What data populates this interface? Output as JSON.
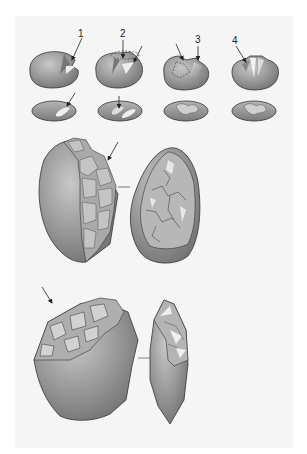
{
  "figure": {
    "type": "illustration",
    "background_color": "#ffffff",
    "panel_color": "#f5f5f5",
    "stone_color": "#8a8a8a",
    "outline_color": "#333333",
    "top_row": {
      "labels": [
        "1",
        "2",
        "3",
        "4"
      ]
    }
  }
}
